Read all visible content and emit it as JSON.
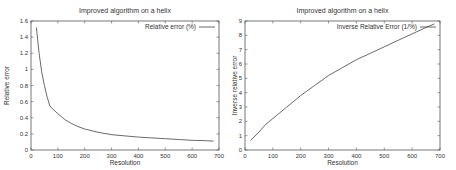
{
  "chart_data": [
    {
      "type": "line",
      "title": "Improved algorithm on a helix",
      "xlabel": "Resolution",
      "ylabel": "Relative error",
      "xlim": [
        0,
        700
      ],
      "ylim": [
        0,
        1.6
      ],
      "xticks": [
        "0",
        "100",
        "200",
        "300",
        "400",
        "500",
        "600",
        "700"
      ],
      "yticks": [
        "0",
        "0.2",
        "0.4",
        "0.6",
        "0.8",
        "1",
        "1.2",
        "1.4",
        "1.6"
      ],
      "grid": false,
      "legend_position": "top-right",
      "series": [
        {
          "name": "Relative error (%)",
          "x": [
            20,
            30,
            40,
            50,
            60,
            70,
            80,
            100,
            125,
            150,
            175,
            200,
            250,
            300,
            350,
            400,
            450,
            500,
            550,
            600,
            650,
            680
          ],
          "values": [
            1.52,
            1.2,
            0.97,
            0.8,
            0.66,
            0.55,
            0.51,
            0.45,
            0.38,
            0.33,
            0.29,
            0.26,
            0.22,
            0.19,
            0.175,
            0.16,
            0.15,
            0.14,
            0.13,
            0.12,
            0.115,
            0.11
          ]
        }
      ]
    },
    {
      "type": "line",
      "title": "Improved algorithm on a helix",
      "xlabel": "Resolution",
      "ylabel": "Inverse relative error",
      "xlim": [
        0,
        700
      ],
      "ylim": [
        0,
        9
      ],
      "xticks": [
        "0",
        "100",
        "200",
        "300",
        "400",
        "500",
        "600",
        "700"
      ],
      "yticks": [
        "0",
        "1",
        "2",
        "3",
        "4",
        "5",
        "6",
        "7",
        "8",
        "9"
      ],
      "grid": false,
      "legend_position": "top-right",
      "series": [
        {
          "name": "Inverse Relative Error (1/%)",
          "x": [
            20,
            50,
            75,
            100,
            150,
            200,
            250,
            300,
            350,
            400,
            450,
            500,
            550,
            600,
            650,
            680
          ],
          "values": [
            0.66,
            1.25,
            1.8,
            2.2,
            3.0,
            3.8,
            4.5,
            5.2,
            5.75,
            6.3,
            6.75,
            7.2,
            7.65,
            8.1,
            8.55,
            8.8
          ]
        }
      ]
    }
  ]
}
